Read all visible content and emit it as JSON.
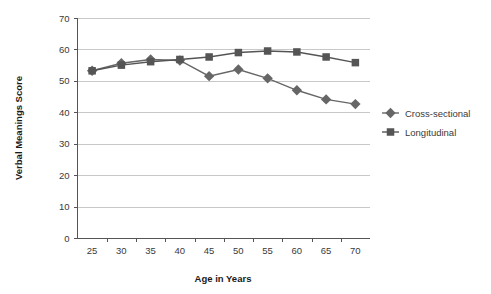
{
  "chart_data": {
    "type": "line",
    "title": "",
    "xlabel": "Age in Years",
    "ylabel": "Verbal Meanings Score",
    "categories": [
      25,
      30,
      35,
      40,
      45,
      50,
      55,
      60,
      65,
      70
    ],
    "xtick_labels": [
      "25",
      "30",
      "35",
      "40",
      "45",
      "50",
      "55",
      "60",
      "65",
      "70"
    ],
    "ytick_labels": [
      "0",
      "10",
      "20",
      "30",
      "40",
      "50",
      "60",
      "70"
    ],
    "ylim": [
      0,
      70
    ],
    "ytick_step": 10,
    "grid": "horizontal",
    "legend_position": "right",
    "series": [
      {
        "name": "Cross-sectional",
        "marker": "diamond",
        "color": "#666666",
        "values": [
          53.2,
          55.6,
          56.8,
          56.5,
          51.5,
          53.6,
          50.8,
          47.0,
          44.1,
          42.6
        ]
      },
      {
        "name": "Longitudinal",
        "marker": "square",
        "color": "#555555",
        "values": [
          53.2,
          55.0,
          56.1,
          56.8,
          57.6,
          59.0,
          59.5,
          59.2,
          57.6,
          55.8
        ]
      }
    ]
  },
  "legend": {
    "items": [
      {
        "label": "Cross-sectional",
        "marker": "diamond"
      },
      {
        "label": "Longitudinal",
        "marker": "square"
      }
    ]
  },
  "colors": {
    "grid": "#c8c8c8",
    "axis": "#555555",
    "series_cross_sectional": "#666666",
    "series_longitudinal": "#555555",
    "background": "#ffffff"
  }
}
